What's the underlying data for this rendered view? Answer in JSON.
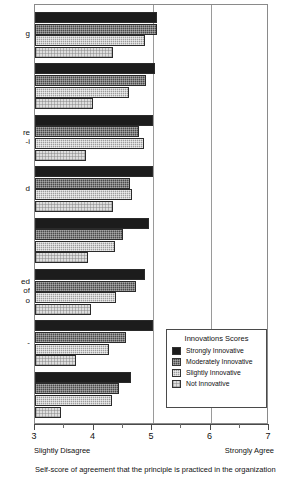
{
  "chart_data": {
    "type": "bar",
    "orientation": "horizontal",
    "title": "",
    "xlabel": "Self-score of agreement that the principle is practiced in the organization",
    "ylabel": "",
    "xlim": [
      3,
      7
    ],
    "xticks": [
      3,
      4,
      5,
      6,
      7
    ],
    "xtick_labels": [
      "3",
      "4",
      "5",
      "6",
      "7"
    ],
    "x_anchor_low": "Slightly Disagree",
    "x_anchor_high": "Strongly Agree",
    "grid": true,
    "gridlines_at": [
      5,
      6
    ],
    "legend_position": "lower right",
    "legend_title": "Innovations Scores",
    "categories": [
      "g",
      "",
      "re\ni-",
      "d",
      "",
      "ed\nof\no",
      "-",
      ""
    ],
    "category_note": "Y-axis category labels are cropped at the left edge of the screenshot; only trailing characters are visible.",
    "series": [
      {
        "name": "Strongly Innovative",
        "color": "#1c1c1c",
        "values": [
          5.08,
          5.05,
          5.02,
          5.02,
          4.95,
          4.88,
          5.02,
          4.64
        ]
      },
      {
        "name": "Moderately Innovative",
        "color": "#4a4a4a",
        "values": [
          5.08,
          4.9,
          4.78,
          4.63,
          4.51,
          4.73,
          4.56,
          4.44
        ]
      },
      {
        "name": "Slightly Innovative",
        "color": "#9c9c9c",
        "values": [
          4.88,
          4.61,
          4.86,
          4.66,
          4.36,
          4.39,
          4.27,
          4.31
        ]
      },
      {
        "name": "Not Innovative",
        "color": "#dedede",
        "values": [
          4.34,
          3.99,
          3.87,
          4.33,
          3.91,
          3.96,
          3.7,
          3.44
        ]
      }
    ]
  },
  "legend": {
    "title": "Innovations Scores",
    "items": [
      {
        "label": "Strongly Innovative",
        "swatch": "solid-black"
      },
      {
        "label": "Moderately Innovative",
        "swatch": "dark-hatch"
      },
      {
        "label": "Slightly Innovative",
        "swatch": "medium-hatch"
      },
      {
        "label": "Not Innovative",
        "swatch": "light-hatch"
      }
    ]
  },
  "axis": {
    "ticks": [
      "3",
      "4",
      "5",
      "6",
      "7"
    ],
    "low_anchor": "Slightly Disagree",
    "high_anchor": "Strongly Agree"
  },
  "caption": "Self-score of agreement that the principle is practiced in the organization"
}
